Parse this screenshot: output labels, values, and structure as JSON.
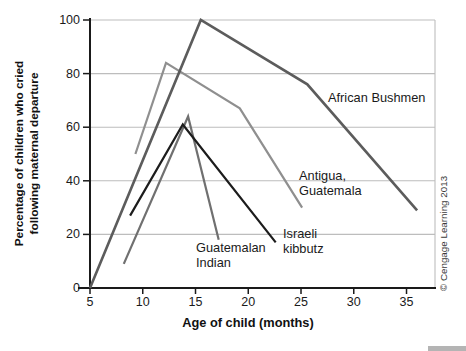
{
  "figure": {
    "background": "#ffffff",
    "copyright": "© Cengage Learning 2013"
  },
  "chart_data": {
    "type": "line",
    "title": "",
    "xlabel": "Age of child (months)",
    "ylabel_lines": [
      "Percentage of children who cried",
      "following maternal departure"
    ],
    "x_ticks": [
      5,
      10,
      15,
      20,
      25,
      30,
      35
    ],
    "y_ticks": [
      0,
      20,
      40,
      60,
      80,
      100
    ],
    "xlim": [
      5,
      37.7
    ],
    "ylim": [
      0,
      100
    ],
    "grid": "horizontal gridlines at every 20, light gray; right and top border light gray",
    "legend": "inline labels next to each line",
    "colors": {
      "axis": "#1a1a1a",
      "gridline": "#bdbdbd",
      "tick_text": "#1a1a1a",
      "copyright_text": "#3a3a3a"
    },
    "series": [
      {
        "name": "Antigua, Guatemala",
        "color": "#8f8f8f",
        "stroke_width": 2.2,
        "points": [
          [
            9.3,
            50
          ],
          [
            12.2,
            84
          ],
          [
            19.2,
            67
          ],
          [
            25.1,
            30
          ]
        ],
        "label_lines": [
          "Antigua,",
          "Guatemala"
        ],
        "label_pos": {
          "left": 299,
          "top": 168
        }
      },
      {
        "name": "Guatemalan Indian",
        "color": "#707070",
        "stroke_width": 2.2,
        "points": [
          [
            8.2,
            9
          ],
          [
            14.3,
            64
          ],
          [
            17.2,
            18
          ]
        ],
        "label_lines": [
          "Guatemalan",
          "Indian"
        ],
        "label_pos": {
          "left": 196,
          "top": 240
        }
      },
      {
        "name": "African Bushmen",
        "color": "#5c5c5c",
        "stroke_width": 2.6,
        "points": [
          [
            5,
            0
          ],
          [
            15.5,
            100
          ],
          [
            25.6,
            76
          ],
          [
            36,
            29
          ]
        ],
        "label_lines": [
          "African Bushmen"
        ],
        "label_pos": {
          "left": 328,
          "top": 90
        }
      },
      {
        "name": "Israeli kibbutz",
        "color": "#1c1c1c",
        "stroke_width": 2.2,
        "points": [
          [
            8.8,
            27
          ],
          [
            13.8,
            61
          ],
          [
            22.6,
            17
          ]
        ],
        "label_lines": [
          "Israeli",
          "kibbutz"
        ],
        "label_pos": {
          "left": 283,
          "top": 226
        }
      }
    ]
  }
}
